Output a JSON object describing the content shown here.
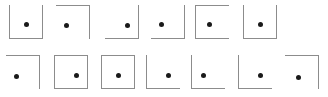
{
  "figure": {
    "width": 328,
    "height": 97,
    "background_color": "#ffffff",
    "line_color": "#8c8c8c",
    "dot_color": "#1a1a1a",
    "line_width": 1,
    "dot_diameter": 5,
    "frame_size": 34,
    "rows": [
      {
        "name": "top-row",
        "y": 5,
        "items": [
          {
            "index": 1,
            "x": 9,
            "edges": [
              "left",
              "right",
              "bottom"
            ],
            "missing_edges": [
              "top"
            ],
            "dot_x": 17,
            "dot_y": 19
          },
          {
            "index": 2,
            "x": 56,
            "edges": [
              "top",
              "right"
            ],
            "missing_edges": [
              "left",
              "bottom"
            ],
            "dot_x": 10,
            "dot_y": 20
          },
          {
            "index": 3,
            "x": 105,
            "edges": [
              "right",
              "bottom"
            ],
            "missing_edges": [
              "left",
              "top"
            ],
            "dot_x": 22,
            "dot_y": 20
          },
          {
            "index": 4,
            "x": 151,
            "edges": [
              "right",
              "bottom"
            ],
            "missing_edges": [
              "left",
              "top"
            ],
            "dot_x": 10,
            "dot_y": 19
          },
          {
            "index": 5,
            "x": 195,
            "edges": [
              "left",
              "top",
              "bottom"
            ],
            "missing_edges": [
              "right"
            ],
            "dot_x": 14,
            "dot_y": 19
          },
          {
            "index": 6,
            "x": 243,
            "edges": [
              "left",
              "right",
              "bottom"
            ],
            "missing_edges": [
              "top"
            ],
            "dot_x": 17,
            "dot_y": 19
          }
        ]
      },
      {
        "name": "bottom-row",
        "y": 6,
        "items": [
          {
            "index": 7,
            "x": 6,
            "edges": [
              "top",
              "right"
            ],
            "missing_edges": [
              "left",
              "bottom"
            ],
            "dot_x": 10,
            "dot_y": 21
          },
          {
            "index": 8,
            "x": 54,
            "edges": [
              "left",
              "top",
              "right",
              "bottom"
            ],
            "missing_edges": [],
            "dot_x": 22,
            "dot_y": 20
          },
          {
            "index": 9,
            "x": 101,
            "edges": [
              "left",
              "top",
              "right",
              "bottom"
            ],
            "missing_edges": [],
            "dot_x": 17,
            "dot_y": 20
          },
          {
            "index": 10,
            "x": 146,
            "edges": [
              "left",
              "bottom"
            ],
            "missing_edges": [
              "top",
              "right"
            ],
            "dot_x": 22,
            "dot_y": 20
          },
          {
            "index": 11,
            "x": 191,
            "edges": [
              "left",
              "bottom"
            ],
            "missing_edges": [
              "top",
              "right"
            ],
            "dot_x": 12,
            "dot_y": 20
          },
          {
            "index": 12,
            "x": 238,
            "edges": [
              "left",
              "bottom"
            ],
            "missing_edges": [
              "top",
              "right"
            ],
            "dot_x": 22,
            "dot_y": 20
          },
          {
            "index": 13,
            "x": 285,
            "edges": [
              "top",
              "right"
            ],
            "missing_edges": [
              "left",
              "bottom"
            ],
            "dot_x": 13,
            "dot_y": 22
          }
        ]
      }
    ]
  }
}
